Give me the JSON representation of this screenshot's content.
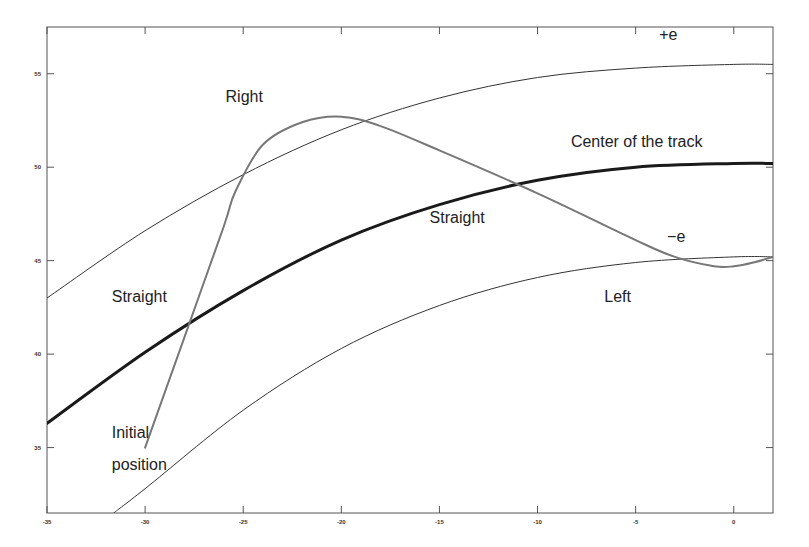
{
  "chart_data": {
    "type": "line",
    "title": "",
    "xlabel": "",
    "ylabel": "",
    "xlim": [
      -35,
      2
    ],
    "ylim": [
      31.5,
      57.5
    ],
    "grid": false,
    "legend": null,
    "x_ticks": [
      -35,
      -30,
      -25,
      -20,
      -15,
      -10,
      -5,
      0
    ],
    "x_tick_labels": [
      "-35",
      "-30",
      "-25",
      "-20",
      "-15",
      "-10",
      "-5",
      "0"
    ],
    "y_ticks": [
      35,
      40,
      45,
      50,
      55
    ],
    "y_tick_labels": [
      "35",
      "40",
      "45",
      "50",
      "55"
    ],
    "series": [
      {
        "name": "+e",
        "style": "thin",
        "color": "#333333",
        "x": [
          -35,
          -30,
          -25,
          -20,
          -15,
          -10,
          -5,
          0,
          2
        ],
        "y": [
          43.0,
          46.6,
          49.6,
          52.0,
          53.7,
          54.8,
          55.3,
          55.5,
          55.5
        ]
      },
      {
        "name": "Center of the track",
        "style": "bold",
        "color": "#1a1a1a",
        "x": [
          -35,
          -30,
          -25,
          -20,
          -15,
          -10,
          -5,
          0,
          2
        ],
        "y": [
          36.3,
          40.1,
          43.4,
          46.1,
          48.0,
          49.3,
          50.0,
          50.2,
          50.2
        ]
      },
      {
        "name": "-e",
        "style": "thin",
        "color": "#333333",
        "x": [
          -31.6,
          -30,
          -25,
          -20,
          -15,
          -10,
          -5,
          0,
          2
        ],
        "y": [
          31.5,
          32.8,
          37.0,
          40.3,
          42.6,
          44.1,
          44.9,
          45.2,
          45.2
        ]
      },
      {
        "name": "Vehicle trajectory",
        "style": "medium",
        "color": "#777777",
        "x": [
          -30,
          -28,
          -26,
          -25.4,
          -24,
          -22,
          -20,
          -18,
          -15,
          -10,
          -5,
          -3,
          -1,
          0,
          1,
          2
        ],
        "y": [
          35.0,
          40.9,
          46.8,
          48.7,
          51.2,
          52.4,
          52.7,
          52.2,
          50.9,
          48.6,
          46.1,
          45.2,
          44.7,
          44.7,
          44.9,
          45.2
        ]
      }
    ],
    "annotations": [
      {
        "text": "+e",
        "x": -3.8,
        "y": 56.8
      },
      {
        "text": "Center of the track",
        "x": -8.3,
        "y": 51.1
      },
      {
        "text": "Right",
        "x": -25.9,
        "y": 53.5
      },
      {
        "text": "Straight",
        "x": -15.5,
        "y": 47.0
      },
      {
        "text": "−e",
        "x": -3.4,
        "y": 46.0
      },
      {
        "text": "Straight",
        "x": -31.7,
        "y": 42.8
      },
      {
        "text": "Left",
        "x": -6.6,
        "y": 42.8
      },
      {
        "text": "Initial",
        "x": -31.7,
        "y": 35.5
      },
      {
        "text": "position",
        "x": -31.7,
        "y": 33.8
      }
    ]
  },
  "plot_area": {
    "left": 47,
    "top": 27,
    "right": 773,
    "bottom": 513
  }
}
